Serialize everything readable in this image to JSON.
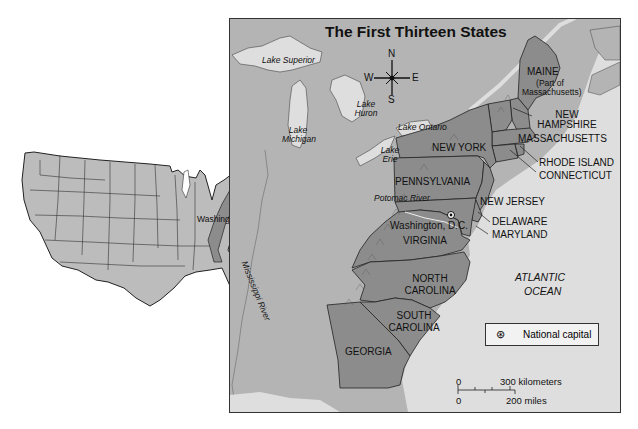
{
  "map": {
    "title": "The First Thirteen States",
    "compass": {
      "n": "N",
      "s": "S",
      "e": "E",
      "w": "W"
    },
    "states": [
      {
        "name": "MAINE",
        "note": "(Part of Massachusetts)"
      },
      {
        "name": "NEW HAMPSHIRE"
      },
      {
        "name": "MASSACHUSETTS"
      },
      {
        "name": "RHODE ISLAND"
      },
      {
        "name": "CONNECTICUT"
      },
      {
        "name": "NEW YORK"
      },
      {
        "name": "PENNSYLVANIA"
      },
      {
        "name": "NEW JERSEY"
      },
      {
        "name": "DELAWARE"
      },
      {
        "name": "MARYLAND"
      },
      {
        "name": "VIRGINIA"
      },
      {
        "name": "NORTH CAROLINA"
      },
      {
        "name": "SOUTH CAROLINA"
      },
      {
        "name": "GEORGIA"
      }
    ],
    "water_features": {
      "lake_superior": "Lake Superior",
      "lake_michigan": "Lake Michigan",
      "lake_huron": "Lake Huron",
      "lake_ontario": "Lake Ontario",
      "lake_erie": "Lake Erie",
      "potomac": "Potomac River",
      "mississippi": "Mississippi River",
      "ocean_line1": "ATLANTIC",
      "ocean_line2": "OCEAN"
    },
    "capital_label": "Washington, D.C.",
    "legend": {
      "symbol": "⊛",
      "label": "National capital"
    },
    "scale": {
      "km_zero": "0",
      "km_label": "300 kilometers",
      "mi_zero": "0",
      "mi_label": "200 miles"
    },
    "colors": {
      "land": "#b4b4b4",
      "states": "#8c8c8c",
      "water": "#dedede",
      "border": "#222222"
    }
  },
  "inset": {
    "capital_label": "Washington, D.C."
  }
}
